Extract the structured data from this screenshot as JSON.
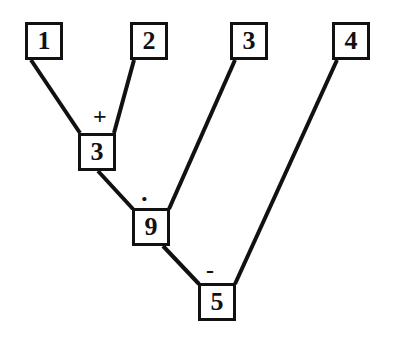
{
  "diagram": {
    "type": "expression-tree",
    "background_color": "#ffffff",
    "stroke_color": "#111111",
    "leaf_nodes": [
      {
        "id": "leaf-1",
        "label": "1",
        "x": 25,
        "y": 22,
        "w": 38,
        "h": 38
      },
      {
        "id": "leaf-2",
        "label": "2",
        "x": 130,
        "y": 22,
        "w": 38,
        "h": 38
      },
      {
        "id": "leaf-3",
        "label": "3",
        "x": 230,
        "y": 22,
        "w": 38,
        "h": 38
      },
      {
        "id": "leaf-4",
        "label": "4",
        "x": 332,
        "y": 22,
        "w": 38,
        "h": 38
      }
    ],
    "internal_nodes": [
      {
        "id": "node-sum",
        "label": "3",
        "operator": "+",
        "x": 78,
        "y": 133,
        "w": 38,
        "h": 38
      },
      {
        "id": "node-product",
        "label": "9",
        "operator": "·",
        "x": 132,
        "y": 208,
        "w": 38,
        "h": 38
      },
      {
        "id": "node-difference",
        "label": "5",
        "operator": "-",
        "x": 198,
        "y": 283,
        "w": 38,
        "h": 38
      }
    ],
    "operator_labels": [
      {
        "id": "op-plus",
        "symbol": "+",
        "x": 93,
        "y": 104
      },
      {
        "id": "op-dot",
        "symbol": "·",
        "x": 140,
        "y": 186
      },
      {
        "id": "op-minus",
        "symbol": "-",
        "x": 206,
        "y": 258
      }
    ],
    "edges": [
      {
        "id": "edge-leaf1-sum",
        "from": "leaf-1",
        "to": "node-sum",
        "x1": 31,
        "y1": 60,
        "x2": 80,
        "y2": 133
      },
      {
        "id": "edge-leaf2-sum",
        "from": "leaf-2",
        "to": "node-sum",
        "x1": 134,
        "y1": 60,
        "x2": 114,
        "y2": 133
      },
      {
        "id": "edge-sum-product",
        "from": "node-sum",
        "to": "node-product",
        "x1": 98,
        "y1": 171,
        "x2": 133,
        "y2": 209
      },
      {
        "id": "edge-leaf3-product",
        "from": "leaf-3",
        "to": "node-product",
        "x1": 235,
        "y1": 60,
        "x2": 169,
        "y2": 209
      },
      {
        "id": "edge-product-difference",
        "from": "node-product",
        "to": "node-difference",
        "x1": 163,
        "y1": 246,
        "x2": 199,
        "y2": 284
      },
      {
        "id": "edge-leaf4-difference",
        "from": "leaf-4",
        "to": "node-difference",
        "x1": 337,
        "y1": 60,
        "x2": 235,
        "y2": 284
      }
    ]
  }
}
